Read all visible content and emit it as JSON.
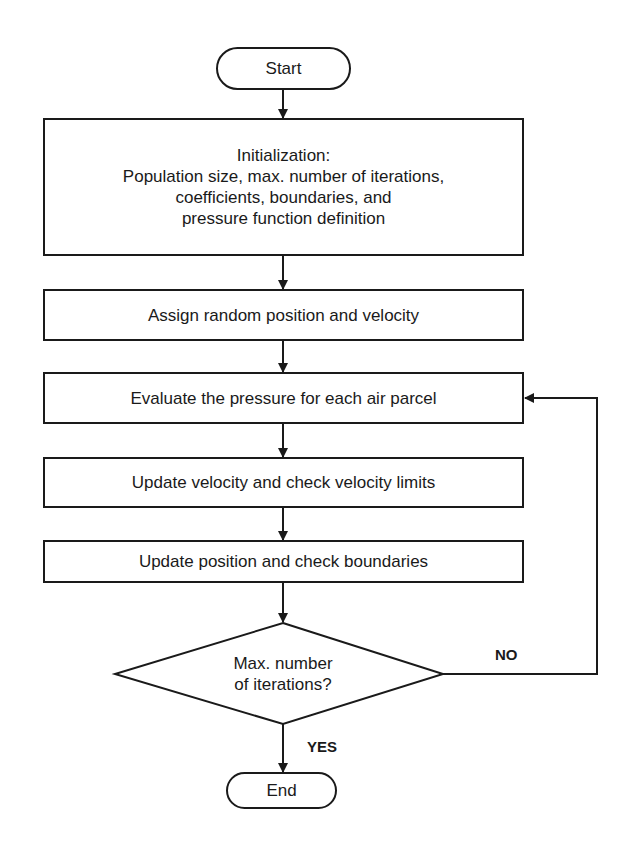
{
  "flowchart": {
    "start": "Start",
    "end": "End",
    "steps": [
      {
        "lines": [
          "Initialization:",
          "Population size, max. number of iterations,",
          "coefficients, boundaries, and",
          "pressure function definition"
        ]
      },
      {
        "label": "Assign random position and velocity"
      },
      {
        "label": "Evaluate the pressure for each air parcel"
      },
      {
        "label": "Update velocity and check velocity limits"
      },
      {
        "label": "Update position and check boundaries"
      }
    ],
    "decision": {
      "lines": [
        "Max. number",
        "of iterations?"
      ],
      "no_label": "NO",
      "yes_label": "YES"
    }
  },
  "colors": {
    "stroke": "#1a1a1a",
    "background": "#ffffff"
  }
}
